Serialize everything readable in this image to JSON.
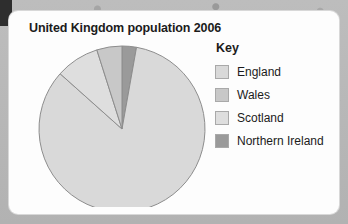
{
  "chart_data": {
    "type": "pie",
    "title": "United Kingdom population 2006",
    "legend_title": "Key",
    "legend_position": "right",
    "start_angle_deg": 0,
    "direction": "clockwise",
    "categories": [
      "England",
      "Wales",
      "Scotland",
      "Northern Ireland"
    ],
    "values": [
      83.8,
      4.9,
      8.5,
      2.8
    ],
    "value_unit": "percent",
    "slice_order_clockwise_from_top": [
      "Northern Ireland",
      "England",
      "Scotland",
      "Wales"
    ],
    "colors": {
      "England": "#d9d9d9",
      "Wales": "#c8c8c8",
      "Scotland": "#dedede",
      "Northern Ireland": "#9a9a9a"
    },
    "slice_outline": "#8d8d8d",
    "xlabel": "",
    "ylabel": "",
    "grid": false
  },
  "card": {
    "title": "United Kingdom population 2006"
  },
  "legend": {
    "title": "Key",
    "items": [
      {
        "label": "England",
        "color": "#d9d9d9"
      },
      {
        "label": "Wales",
        "color": "#c8c8c8"
      },
      {
        "label": "Scotland",
        "color": "#dedede"
      },
      {
        "label": "Northern Ireland",
        "color": "#9a9a9a"
      }
    ]
  }
}
